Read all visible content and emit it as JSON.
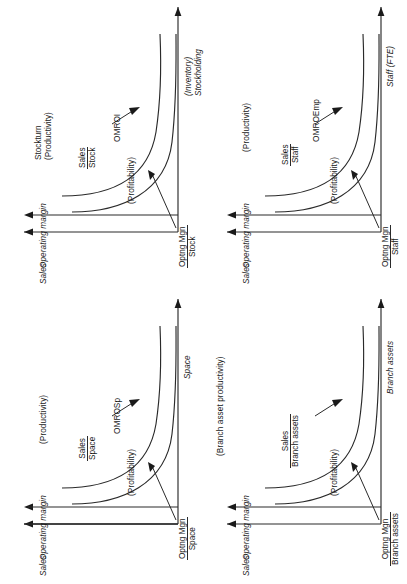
{
  "figure": {
    "type": "diagram",
    "orientation": "page rotated 90 degrees counter-clockwise in screenshot",
    "panel_count": 4
  },
  "common": {
    "y_axis_labels": [
      "Sales",
      "Operating margin"
    ],
    "upper_curve_note": "productivity ratio curve",
    "lower_curve_note": "profitability ratio curve",
    "profitability_label": "(Profitability)"
  },
  "panels": [
    {
      "id": "space",
      "x_axis_label": "Space",
      "x_axis_sub": "",
      "productivity_ratio_num": "Sales",
      "productivity_ratio_den": "Space",
      "productivity_label": "(Productivity)",
      "productivity_name": "",
      "profitability_ratio_num": "Optng Mgn",
      "profitability_ratio_den": "Space",
      "profitability_label": "(Profitability)",
      "profitability_name": "OMROSp",
      "y_labels": [
        "Sales",
        "Operating margin"
      ]
    },
    {
      "id": "branch-assets",
      "x_axis_label": "Branch assets",
      "x_axis_sub": "",
      "productivity_ratio_num": "Sales",
      "productivity_ratio_den": "Branch assets",
      "productivity_label": "(Branch asset productivity)",
      "productivity_name": "",
      "profitability_ratio_num": "Optng Mgn",
      "profitability_ratio_den": "Branch assets",
      "profitability_label": "(Profitability)",
      "profitability_name": "",
      "y_labels": [
        "Sales",
        "Operating margin"
      ]
    },
    {
      "id": "stock",
      "x_axis_label": "Stockholding",
      "x_axis_sub": "(Inventory)",
      "productivity_ratio_num": "Sales",
      "productivity_ratio_den": "Stock",
      "productivity_label": "(Productivity)",
      "productivity_name": "Stockturn",
      "profitability_ratio_num": "Optng Mgn",
      "profitability_ratio_den": "Stock",
      "profitability_label": "(Profitability)",
      "profitability_name": "OMROI",
      "y_labels": [
        "Sales",
        "Operating margin"
      ]
    },
    {
      "id": "staff",
      "x_axis_label": "Staff (FTE)",
      "x_axis_sub": "",
      "productivity_ratio_num": "Sales",
      "productivity_ratio_den": "Staff",
      "productivity_label": "(Productivity)",
      "productivity_name": "",
      "profitability_ratio_num": "Optng Mgn",
      "profitability_ratio_den": "Staff",
      "profitability_label": "(Profitability)",
      "profitability_name": "OMROEmp",
      "y_labels": [
        "Sales",
        "Operating margin"
      ]
    }
  ],
  "colors": {
    "ink": "#1a1a1a",
    "line": "#2a2a2a",
    "background": "#ffffff"
  }
}
